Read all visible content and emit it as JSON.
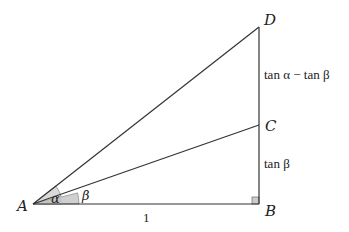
{
  "diagram": {
    "type": "right-triangle-tangent-difference",
    "points": {
      "A": {
        "label": "A",
        "x": 33,
        "y": 204
      },
      "B": {
        "label": "B",
        "x": 259,
        "y": 204
      },
      "C": {
        "label": "C",
        "x": 259,
        "y": 125
      },
      "D": {
        "label": "D",
        "x": 259,
        "y": 27
      }
    },
    "segments": [
      "AB",
      "BD",
      "AC",
      "AD"
    ],
    "angles": {
      "alpha": {
        "label": "α",
        "vertex": "A",
        "between": [
          "AB",
          "AD"
        ]
      },
      "beta": {
        "label": "β",
        "vertex": "A",
        "between": [
          "AB",
          "AC"
        ]
      }
    },
    "edge_labels": {
      "AB": "1",
      "BC": "tan β",
      "CD": "tan α − tan β"
    },
    "right_angle_at": "B",
    "colors": {
      "stroke": "#333333",
      "angle_fill": "#d4d4d4",
      "angle_fill_inner": "#c4c4c4",
      "right_angle_fill": "#cccccc"
    }
  }
}
